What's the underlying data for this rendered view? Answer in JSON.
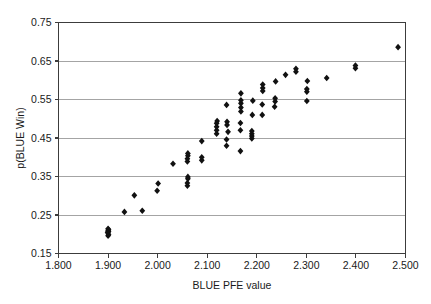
{
  "chart_data": {
    "type": "scatter",
    "title": "",
    "xlabel": "BLUE PFE value",
    "ylabel": "p(BLUE Win)",
    "xlim": [
      1.8,
      2.5
    ],
    "ylim": [
      0.15,
      0.75
    ],
    "xticks": [
      1.8,
      1.9,
      2.0,
      2.1,
      2.2,
      2.3,
      2.4,
      2.5
    ],
    "xtick_labels": [
      "1.800",
      "1.900",
      "2.000",
      "2.100",
      "2.200",
      "2.300",
      "2.400",
      "2.500"
    ],
    "yticks": [
      0.15,
      0.25,
      0.35,
      0.45,
      0.55,
      0.65,
      0.75
    ],
    "ytick_labels": [
      "0.15",
      "0.25",
      "0.35",
      "0.45",
      "0.55",
      "0.65",
      "0.75"
    ],
    "grid": "horizontal",
    "legend": null,
    "marker": "diamond",
    "marker_color": "#111111",
    "series": [
      {
        "name": "BLUE",
        "points": [
          [
            1.9,
            0.196
          ],
          [
            1.9,
            0.203
          ],
          [
            1.9,
            0.209
          ],
          [
            1.9,
            0.214
          ],
          [
            1.901,
            0.199
          ],
          [
            1.901,
            0.207
          ],
          [
            1.901,
            0.212
          ],
          [
            1.899,
            0.205
          ],
          [
            1.933,
            0.258
          ],
          [
            1.969,
            0.261
          ],
          [
            1.953,
            0.301
          ],
          [
            1.999,
            0.313
          ],
          [
            2.001,
            0.332
          ],
          [
            2.031,
            0.383
          ],
          [
            2.06,
            0.326
          ],
          [
            2.06,
            0.333
          ],
          [
            2.061,
            0.344
          ],
          [
            2.061,
            0.349
          ],
          [
            2.06,
            0.389
          ],
          [
            2.06,
            0.396
          ],
          [
            2.061,
            0.404
          ],
          [
            2.061,
            0.41
          ],
          [
            2.089,
            0.392
          ],
          [
            2.089,
            0.4
          ],
          [
            2.089,
            0.442
          ],
          [
            2.119,
            0.461
          ],
          [
            2.119,
            0.47
          ],
          [
            2.119,
            0.479
          ],
          [
            2.119,
            0.488
          ],
          [
            2.12,
            0.494
          ],
          [
            2.139,
            0.43
          ],
          [
            2.139,
            0.446
          ],
          [
            2.14,
            0.484
          ],
          [
            2.14,
            0.492
          ],
          [
            2.139,
            0.536
          ],
          [
            2.142,
            0.466
          ],
          [
            2.167,
            0.416
          ],
          [
            2.167,
            0.47
          ],
          [
            2.167,
            0.489
          ],
          [
            2.168,
            0.519
          ],
          [
            2.168,
            0.529
          ],
          [
            2.168,
            0.54
          ],
          [
            2.168,
            0.548
          ],
          [
            2.168,
            0.566
          ],
          [
            2.19,
            0.449
          ],
          [
            2.19,
            0.455
          ],
          [
            2.19,
            0.461
          ],
          [
            2.19,
            0.468
          ],
          [
            2.191,
            0.51
          ],
          [
            2.192,
            0.547
          ],
          [
            2.211,
            0.51
          ],
          [
            2.211,
            0.537
          ],
          [
            2.212,
            0.572
          ],
          [
            2.212,
            0.58
          ],
          [
            2.212,
            0.589
          ],
          [
            2.236,
            0.531
          ],
          [
            2.237,
            0.545
          ],
          [
            2.237,
            0.553
          ],
          [
            2.238,
            0.597
          ],
          [
            2.258,
            0.614
          ],
          [
            2.279,
            0.622
          ],
          [
            2.279,
            0.63
          ],
          [
            2.301,
            0.546
          ],
          [
            2.301,
            0.57
          ],
          [
            2.301,
            0.577
          ],
          [
            2.302,
            0.598
          ],
          [
            2.341,
            0.606
          ],
          [
            2.399,
            0.631
          ],
          [
            2.399,
            0.638
          ],
          [
            2.485,
            0.686
          ]
        ]
      }
    ]
  },
  "axes": {
    "x_axis_name": "x-axis",
    "y_axis_name": "y-axis"
  }
}
